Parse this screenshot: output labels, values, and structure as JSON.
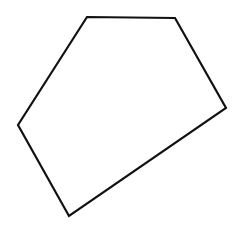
{
  "diagram": {
    "type": "polygon",
    "shape": "pentagon",
    "background_color": "#ffffff",
    "stroke_color": "#111111",
    "stroke_width": 2.2,
    "fill": "none",
    "vertices": [
      {
        "x": 87,
        "y": 17
      },
      {
        "x": 175,
        "y": 18
      },
      {
        "x": 226,
        "y": 108
      },
      {
        "x": 69,
        "y": 216
      },
      {
        "x": 18,
        "y": 125
      }
    ]
  }
}
